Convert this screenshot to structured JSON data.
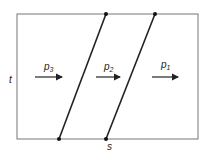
{
  "diagram": {
    "type": "space-time shock wave diagram",
    "axis_labels": {
      "vertical": "t",
      "horizontal": "s"
    },
    "regions": [
      {
        "label": "p",
        "sub": "3",
        "x": 47,
        "arrow_x1": 35,
        "arrow_x2": 63
      },
      {
        "label": "p",
        "sub": "2",
        "x": 106,
        "arrow_x1": 96,
        "arrow_x2": 121
      },
      {
        "label": "p",
        "sub": "1",
        "x": 162,
        "arrow_x1": 152,
        "arrow_x2": 179
      }
    ],
    "lines": [
      {
        "x1": 59,
        "y1": 139,
        "x2": 106,
        "y2": 14
      },
      {
        "x1": 106,
        "y1": 139,
        "x2": 155,
        "y2": 14
      }
    ],
    "colors": {
      "stroke": "#222222",
      "frame": "#777777"
    }
  }
}
